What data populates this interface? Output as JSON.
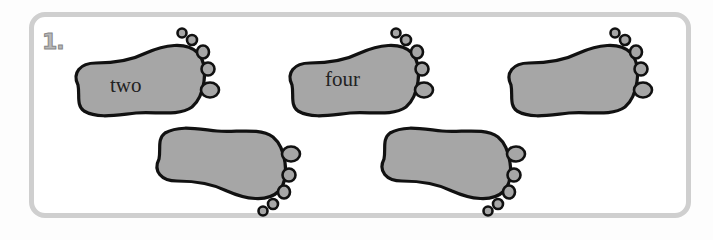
{
  "exercise": {
    "number": "1.",
    "colors": {
      "sole_fill": "#a6a6a6",
      "outline": "#111111",
      "border": "#cfcfcf"
    },
    "footprints": [
      {
        "word": "two",
        "row": "top",
        "orientation": "toes-up"
      },
      {
        "word": "four",
        "row": "top",
        "orientation": "toes-up"
      },
      {
        "word": "",
        "row": "top",
        "orientation": "toes-up"
      },
      {
        "word": "",
        "row": "bottom",
        "orientation": "toes-down"
      },
      {
        "word": "",
        "row": "bottom",
        "orientation": "toes-down"
      }
    ]
  }
}
